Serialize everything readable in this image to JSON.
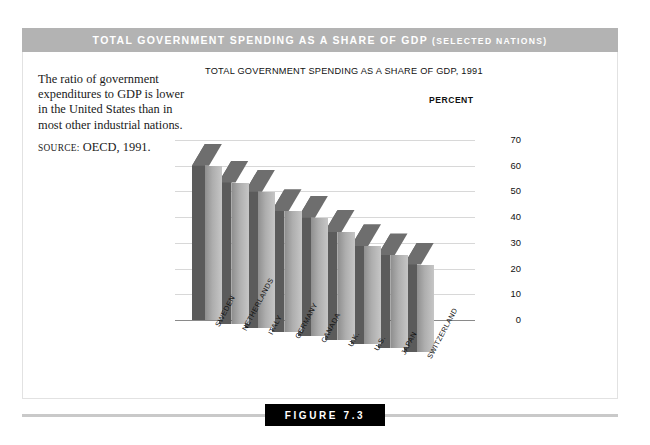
{
  "banner": {
    "title_main": "Total Government Spending as a Share of GDP",
    "title_paren": "(selected nations)"
  },
  "caption": {
    "body": "The ratio of government expenditures to GDP is lower in the United States than in most other industrial nations.",
    "source_label": "SOURCE:",
    "source_value": "OECD, 1991."
  },
  "footer": {
    "figure_label": "FIGURE 7.3"
  },
  "colors": {
    "banner_bg": "#b3b3b3",
    "bar_front_light": "#c6c6c6",
    "bar_front_mid": "#aeaeae",
    "bar_front_dark": "#8f8f8f",
    "bar_side": "#5b5b5b",
    "bar_top": "#6e6e6e",
    "gridline": "#d8d8d8",
    "figure_box": "#000000"
  },
  "chart_data": {
    "type": "bar",
    "title": "TOTAL GOVERNMENT SPENDING AS A SHARE OF GDP, 1991",
    "ylabel": "PERCENT",
    "xlabel": "",
    "ylim": [
      0,
      70
    ],
    "yticks": [
      70,
      60,
      50,
      40,
      30,
      20,
      10,
      0
    ],
    "grid": true,
    "legend": false,
    "projection": "3d-skewed",
    "categories": [
      "SWEDEN",
      "NETHERLANDS",
      "ITALY",
      "GERMANY",
      "CANADA",
      "U.K.",
      "U.S.",
      "JAPAN",
      "SWITZERLAND"
    ],
    "values": [
      60,
      55,
      53,
      47,
      46,
      42,
      38,
      36,
      34
    ]
  }
}
